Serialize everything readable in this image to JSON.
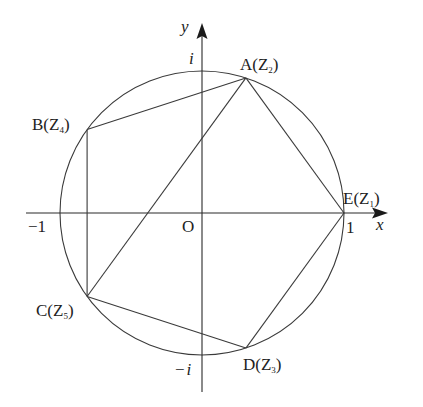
{
  "diagram": {
    "canvas": {
      "width": 423,
      "height": 407
    },
    "origin_px": {
      "x": 202,
      "y": 213
    },
    "radius_px": 142,
    "colors": {
      "line": "#3a3a3a",
      "text": "#222222",
      "background": "#ffffff"
    },
    "axes": {
      "x": {
        "label": "x",
        "from_px": 26,
        "to_px": 388,
        "tick_labels": [
          "-1",
          "1"
        ]
      },
      "y": {
        "label": "y",
        "from_px": 392,
        "to_px": 23,
        "tick_labels": [
          "i",
          "-i"
        ]
      },
      "origin_label": "O"
    },
    "labels": {
      "x_axis": "x",
      "y_axis": "y",
      "origin": "O",
      "neg_one": "−1",
      "one": "1",
      "i": "i",
      "neg_i_minus": "−",
      "neg_i_i": "i"
    },
    "points": [
      {
        "name": "E",
        "sub": "1",
        "angle_deg": 0,
        "text": "E(Z",
        "close": ")"
      },
      {
        "name": "A",
        "sub": "2",
        "angle_deg": 72,
        "text": "A(Z",
        "close": ")"
      },
      {
        "name": "B",
        "sub": "4",
        "angle_deg": 144,
        "text": "B(Z",
        "close": ")"
      },
      {
        "name": "C",
        "sub": "5",
        "angle_deg": 216,
        "text": "C(Z",
        "close": ")"
      },
      {
        "name": "D",
        "sub": "3",
        "angle_deg": 288,
        "text": "D(Z",
        "close": ")"
      }
    ],
    "segments": [
      [
        "E",
        "A"
      ],
      [
        "A",
        "B"
      ],
      [
        "B",
        "C"
      ],
      [
        "C",
        "D"
      ],
      [
        "D",
        "E"
      ],
      [
        "A",
        "C"
      ]
    ]
  }
}
